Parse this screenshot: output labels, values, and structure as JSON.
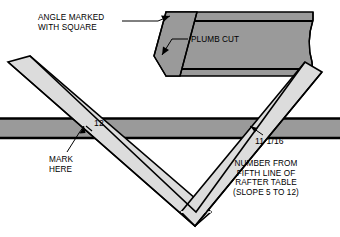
{
  "figure": {
    "labels": {
      "angle_marked": "ANGLE MARKED\nWITH SQUARE",
      "plumb_cut": "PLUMB CUT",
      "twelve": "12",
      "mark_here": "MARK\nHERE",
      "eleven_sixteenths": "11 1/16",
      "number_from_table": "NUMBER FROM\nFIFTH LINE OF\nRAFTER TABLE\n(SLOPE 5 TO 12)"
    },
    "colors": {
      "background": "#ffffff",
      "board_dark": "#9a9a9a",
      "square_light": "#dcdcdc",
      "outline": "#000000",
      "text": "#000000"
    },
    "parts": {
      "rafter_board": "dark gray board with plumb cut end, upper right",
      "horizontal_board": "dark gray board spanning full width",
      "framing_square": "light gray V-shaped square overlaying the board"
    }
  }
}
